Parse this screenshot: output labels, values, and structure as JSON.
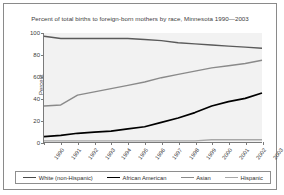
{
  "title": "Percent of total births to foreign-born mothers by race, Minnesota 1990—2003",
  "axes": {
    "ylabel": "Percent",
    "yticks": [
      "0",
      "20",
      "40",
      "60",
      "80",
      "100"
    ],
    "xticks": [
      "1990",
      "1991",
      "1992",
      "1993",
      "1994",
      "1995",
      "1996",
      "1997",
      "1998",
      "1999",
      "2000",
      "2001",
      "2002",
      "2003"
    ]
  },
  "legend": {
    "items": [
      {
        "label": "White (non-Hispanic)",
        "color": "#4a4a4a"
      },
      {
        "label": "African American",
        "color": "#000000"
      },
      {
        "label": "Asian",
        "color": "#8a8a8a"
      },
      {
        "label": "Hispanic",
        "color": "#a8a8a8"
      }
    ]
  },
  "chart_data": {
    "type": "line",
    "title": "Percent of total births to foreign-born mothers by race, Minnesota 1990—2003",
    "xlabel": "",
    "ylabel": "Percent",
    "ylim": [
      0,
      100
    ],
    "xlim": [
      1990,
      2003
    ],
    "grid": false,
    "legend_position": "bottom",
    "categories": [
      "1990",
      "1991",
      "1992",
      "1993",
      "1994",
      "1995",
      "1996",
      "1997",
      "1998",
      "1999",
      "2000",
      "2001",
      "2002",
      "2003"
    ],
    "series": [
      {
        "name": "White (non-Hispanic)",
        "color": "#5a5a5a",
        "values": [
          97,
          95,
          95,
          95,
          95,
          95,
          94,
          93,
          91,
          90,
          89,
          88,
          87,
          86
        ]
      },
      {
        "name": "African American",
        "color": "#000000",
        "values": [
          5,
          6,
          8,
          9,
          10,
          12,
          14,
          18,
          22,
          27,
          33,
          37,
          40,
          45
        ]
      },
      {
        "name": "Asian",
        "color": "#8a8a8a",
        "values": [
          33,
          34,
          43,
          46,
          49,
          52,
          55,
          59,
          62,
          65,
          68,
          70,
          72,
          75
        ]
      },
      {
        "name": "Hispanic",
        "color": "#a8a8a8",
        "values": [
          1,
          1,
          1,
          1,
          1,
          1,
          1,
          1,
          1,
          1,
          2,
          2,
          2,
          2
        ]
      }
    ]
  }
}
